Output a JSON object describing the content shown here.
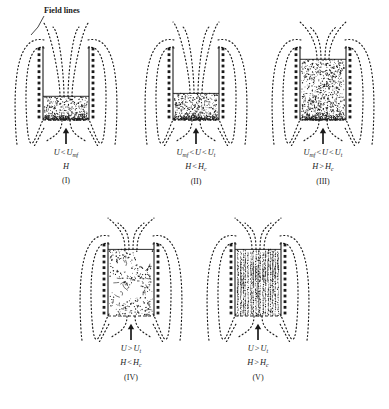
{
  "figure": {
    "annotation": {
      "label": "Field lines"
    },
    "ink_color": "#1a1a1a",
    "panels": [
      {
        "id": "I",
        "number": "(I)",
        "velocity_condition": "U < Umf",
        "velocity_parts": {
          "sym1": "U",
          "op": "<",
          "sym2": "U",
          "sub2": "mf"
        },
        "field_condition": "H",
        "field_parts": {
          "sym1": "H",
          "op": "",
          "sym2": "",
          "sub2": ""
        },
        "bed_state": "packed-bed-low",
        "bed_height_fraction": 0.32,
        "bed_texture": "dense-stipple"
      },
      {
        "id": "II",
        "number": "(II)",
        "velocity_condition": "Umf < U < Ut",
        "velocity_parts": {
          "sym1": "U",
          "sub1": "mf",
          "op": "<",
          "sym2": "U",
          "op2": "<",
          "sym3": "U",
          "sub3": "t"
        },
        "field_condition": "H < Hc",
        "field_parts": {
          "sym1": "H",
          "op": "<",
          "sym2": "H",
          "sub2": "c"
        },
        "bed_state": "stabilized-bed-low",
        "bed_height_fraction": 0.36,
        "bed_texture": "dense-stipple"
      },
      {
        "id": "III",
        "number": "(III)",
        "velocity_condition": "Umf < U < Ut",
        "velocity_parts": {
          "sym1": "U",
          "sub1": "mf",
          "op": "<",
          "sym2": "U",
          "op2": "<",
          "sym3": "U",
          "sub3": "t"
        },
        "field_condition": "H > Hc",
        "field_parts": {
          "sym1": "H",
          "op": ">",
          "sym2": "H",
          "sub2": "c"
        },
        "bed_state": "expanded-stabilized-bed",
        "bed_height_fraction": 0.82,
        "bed_texture": "dense-stipple"
      },
      {
        "id": "IV",
        "number": "(IV)",
        "velocity_condition": "U > Ut",
        "velocity_parts": {
          "sym1": "U",
          "op": ">",
          "sym2": "U",
          "sub2": "t"
        },
        "field_condition": "H < Hc",
        "field_parts": {
          "sym1": "H",
          "op": "<",
          "sym2": "H",
          "sub2": "c"
        },
        "bed_state": "bubbling-turbulent-bed",
        "bed_height_fraction": 0.9,
        "bed_texture": "sparse-turbulent"
      },
      {
        "id": "V",
        "number": "(V)",
        "velocity_condition": "U > Ut",
        "velocity_parts": {
          "sym1": "U",
          "op": ">",
          "sym2": "U",
          "sub2": "t"
        },
        "field_condition": "H > Hc",
        "field_parts": {
          "sym1": "H",
          "op": ">",
          "sym2": "H",
          "sub2": "c"
        },
        "bed_state": "chain-structured-bed",
        "bed_height_fraction": 0.9,
        "bed_texture": "vertical-chains"
      }
    ]
  }
}
